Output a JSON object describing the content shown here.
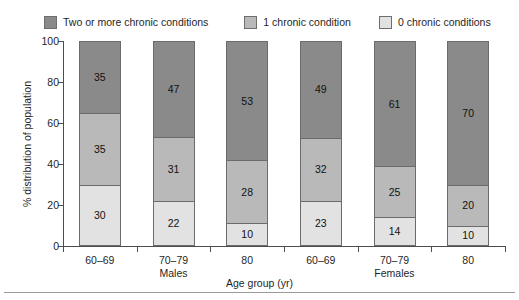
{
  "chart_data": {
    "type": "bar",
    "subtype": "stacked-bar-100",
    "title": "",
    "xlabel": "Age group (yr)",
    "ylabel": "% distribution of population",
    "ylim": [
      0,
      100
    ],
    "yticks": [
      0,
      20,
      40,
      60,
      80,
      100
    ],
    "grid": false,
    "legend_position": "top",
    "categories": [
      "60–69",
      "70–79",
      "80",
      "60–69",
      "70–79",
      "80"
    ],
    "groups": [
      "Males",
      "Females"
    ],
    "group_spans": [
      {
        "label": "Males",
        "categories": [
          "60–69",
          "70–79",
          "80"
        ]
      },
      {
        "label": "Females",
        "categories": [
          "60–69",
          "70–79",
          "80"
        ]
      }
    ],
    "series": [
      {
        "name": "Two or more chronic conditions",
        "color": "#8a8a8a",
        "values": [
          35,
          47,
          53,
          49,
          61,
          70
        ]
      },
      {
        "name": "1 chronic condition",
        "color": "#b9b9b9",
        "values": [
          35,
          31,
          28,
          32,
          25,
          20
        ]
      },
      {
        "name": "0 chronic conditions",
        "color": "#e2e2e2",
        "values": [
          30,
          22,
          10,
          23,
          14,
          10
        ]
      }
    ],
    "bars": [
      {
        "group": "Males",
        "category": "60–69",
        "two_or_more": 35,
        "one": 35,
        "zero": 30
      },
      {
        "group": "Males",
        "category": "70–79",
        "two_or_more": 47,
        "one": 31,
        "zero": 22
      },
      {
        "group": "Males",
        "category": "80",
        "two_or_more": 53,
        "one": 28,
        "zero": 10
      },
      {
        "group": "Females",
        "category": "60–69",
        "two_or_more": 49,
        "one": 32,
        "zero": 23
      },
      {
        "group": "Females",
        "category": "70–79",
        "two_or_more": 61,
        "one": 25,
        "zero": 14
      },
      {
        "group": "Females",
        "category": "80",
        "two_or_more": 70,
        "one": 20,
        "zero": 10
      }
    ]
  },
  "legend": {
    "items": [
      {
        "label": "Two or more chronic conditions",
        "color": "#8a8a8a"
      },
      {
        "label": "1 chronic condition",
        "color": "#b9b9b9"
      },
      {
        "label": "0 chronic conditions",
        "color": "#e2e2e2"
      }
    ]
  },
  "axes": {
    "y": {
      "label": "% distribution of population",
      "ticks": [
        "0",
        "20",
        "40",
        "60",
        "80",
        "100"
      ]
    },
    "x": {
      "label": "Age group (yr)",
      "categories": [
        "60–69",
        "70–79",
        "80",
        "60–69",
        "70–79",
        "80"
      ],
      "groups": [
        "Males",
        "Females"
      ]
    }
  },
  "colors": {
    "two_or_more": "#8a8a8a",
    "one": "#b9b9b9",
    "zero": "#e2e2e2",
    "axis": "#4d4d4d",
    "outline": "#6b6b6b",
    "text": "#1f1f1f",
    "background": "#ffffff"
  }
}
